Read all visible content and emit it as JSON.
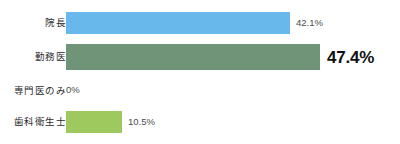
{
  "chart_data": {
    "type": "bar",
    "orientation": "horizontal",
    "title": "",
    "subtitle": "",
    "xlabel": "",
    "ylabel": "",
    "grid": false,
    "legend": null,
    "xlim": [
      0,
      47.4
    ],
    "categories": [
      "院長",
      "勤務医",
      "専門医のみ",
      "歯科衛生士"
    ],
    "values": [
      42.1,
      47.4,
      0,
      10.5
    ],
    "value_labels": [
      "42.1%",
      "47.4%",
      "0%",
      "10.5%"
    ],
    "series": [
      {
        "name": "",
        "values": [
          42.1,
          47.4,
          0,
          10.5
        ]
      }
    ],
    "bars": [
      {
        "category": "院長",
        "value": 42.1,
        "value_label": "42.1%",
        "color": "#68B8EC",
        "emphasis": false,
        "bar_width_px": 224
      },
      {
        "category": "勤務医",
        "value": 47.4,
        "value_label": "47.4%",
        "color": "#709477",
        "emphasis": true,
        "bar_width_px": 254
      },
      {
        "category": "専門医のみ",
        "value": 0,
        "value_label": "0%",
        "color": "#ffffff",
        "emphasis": false,
        "bar_width_px": 0
      },
      {
        "category": "歯科衛生士",
        "value": 10.5,
        "value_label": "10.5%",
        "color": "#9EC95E",
        "emphasis": false,
        "bar_width_px": 56
      }
    ],
    "colors": {
      "bar_blue": "#68B8EC",
      "bar_green": "#709477",
      "bar_light_green": "#9EC95E",
      "label_text": "#2b2b2b",
      "value_text": "#4d4d4d",
      "emphasis_text": "#111111",
      "background": "#ffffff"
    }
  }
}
